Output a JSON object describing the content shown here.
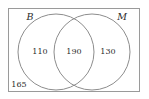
{
  "diagram": {
    "type": "venn-two-set",
    "title": "",
    "canvas": {
      "width": 149,
      "height": 99,
      "background": "#ffffff"
    },
    "universe": {
      "name": "universal-set-rectangle",
      "x": 8,
      "y": 8,
      "width": 132,
      "height": 84,
      "stroke": "#9a9a9a"
    },
    "sets": [
      {
        "id": "B",
        "label": "B",
        "label_x": 30,
        "label_y": 20,
        "cx": 56,
        "cy": 52,
        "r": 38,
        "stroke": "#8d8d8d"
      },
      {
        "id": "M",
        "label": "M",
        "label_x": 120,
        "label_y": 20,
        "cx": 92,
        "cy": 52,
        "r": 38,
        "stroke": "#8d8d8d"
      }
    ],
    "regions": [
      {
        "id": "B-only",
        "label": "110",
        "value": 110,
        "x": 40,
        "y": 54
      },
      {
        "id": "B-and-M",
        "label": "190",
        "value": 190,
        "x": 74,
        "y": 54
      },
      {
        "id": "M-only",
        "label": "130",
        "value": 130,
        "x": 108,
        "y": 54
      }
    ],
    "outside": {
      "id": "neither",
      "label": "165",
      "value": 165,
      "x": 19,
      "y": 87
    }
  }
}
